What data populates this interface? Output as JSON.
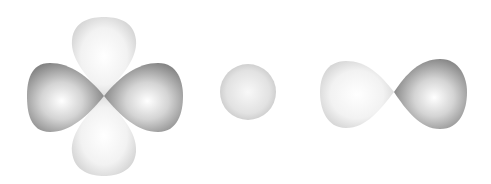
{
  "figure": {
    "orbitals": [
      {
        "name": "d-orbital",
        "lobes": 4,
        "center": [
          104,
          96
        ],
        "dark_lobes": "horizontal",
        "light_lobes": "vertical"
      },
      {
        "name": "s-orbital",
        "lobes": 1,
        "center": [
          248,
          92
        ],
        "radius": 28
      },
      {
        "name": "p-orbital",
        "lobes": 2,
        "center": [
          394,
          92
        ],
        "light_lobe": "left",
        "dark_lobe": "right"
      }
    ],
    "colors": {
      "dark_lobe": "#8a8a8a",
      "light_lobe": "#dcdcdc",
      "background": "#ffffff"
    }
  }
}
